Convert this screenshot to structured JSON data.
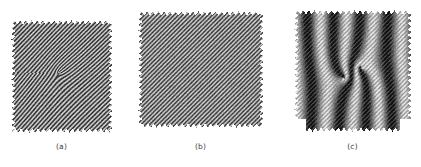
{
  "figure": {
    "background_color": "#ffffff",
    "label_color": "#3b3b3b",
    "fringe_dark_color": "#111111",
    "fringe_light_color": "#e8e8e8",
    "panel_count": 3
  },
  "panels": [
    {
      "id": "a",
      "label": "(a)",
      "description": "object interferogram with carrier fringes distorted by a central optical vortex",
      "pattern": "vortex-carrier-fringes",
      "x": 11,
      "y": 19,
      "width": 101,
      "height": 114,
      "carrier_angle_deg": 45,
      "carrier_period_px": 3.0,
      "vortex": {
        "center_x_frac": 0.47,
        "center_y_frac": 0.47,
        "strength": 1.0,
        "radius_frac": 0.55
      },
      "contrast": 0.75,
      "mean_level": 0.52,
      "ragged_edges": true
    },
    {
      "id": "b",
      "label": "(b)",
      "description": "reference interferogram with straight uniform carrier fringes",
      "pattern": "uniform-carrier-fringes",
      "x": 138,
      "y": 10,
      "width": 125,
      "height": 118,
      "carrier_angle_deg": 45,
      "carrier_period_px": 3.0,
      "vortex": null,
      "contrast": 0.66,
      "mean_level": 0.54,
      "ragged_edges": true
    },
    {
      "id": "c",
      "label": "(c)",
      "description": "moire pattern of the phase difference showing broad dark bands and a double vortex core",
      "pattern": "moire-double-vortex",
      "x": 294,
      "y": 9,
      "width": 117,
      "height": 123,
      "carrier_angle_deg": 45,
      "carrier_period_px": 3.0,
      "moire_bands": 5,
      "vortices": [
        {
          "center_x_frac": 0.42,
          "center_y_frac": 0.56,
          "sign": 1
        },
        {
          "center_x_frac": 0.57,
          "center_y_frac": 0.47,
          "sign": -1
        }
      ],
      "contrast": 0.95,
      "mean_level": 0.45,
      "ragged_edges": true,
      "bottom_notch": true
    }
  ]
}
